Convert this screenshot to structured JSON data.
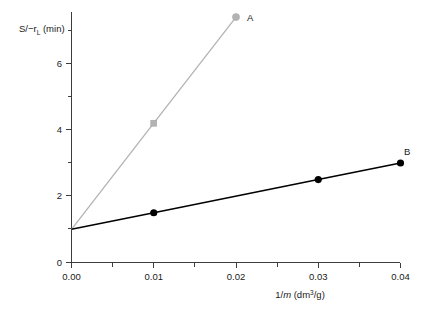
{
  "chart_data": {
    "type": "line",
    "title": "",
    "xlabel": "1/m (dm³/g)",
    "ylabel": "S/−rₗ (min)",
    "xlim": [
      0.0,
      0.04
    ],
    "ylim": [
      0.0,
      7.7
    ],
    "grid": false,
    "legend_position": "inline-end-of-line",
    "x_ticks": [
      {
        "value": 0.0,
        "label": "0.00"
      },
      {
        "value": 0.01,
        "label": "0.01"
      },
      {
        "value": 0.02,
        "label": "0.02"
      },
      {
        "value": 0.03,
        "label": "0.03"
      },
      {
        "value": 0.04,
        "label": "0.04"
      }
    ],
    "x_minor_ticks": [
      0.005,
      0.015,
      0.025,
      0.035
    ],
    "y_ticks": [
      {
        "value": 0,
        "label": "0"
      },
      {
        "value": 2,
        "label": "2"
      },
      {
        "value": 4,
        "label": "4"
      },
      {
        "value": 6,
        "label": "6"
      }
    ],
    "y_minor_ticks": [
      1,
      3,
      5,
      7
    ],
    "series": [
      {
        "name": "A",
        "label": "A",
        "color": "#b3b3b3",
        "marker": "square",
        "marker_color": "#b3b3b3",
        "x": [
          0.0,
          0.01,
          0.02
        ],
        "values": [
          1.0,
          4.2,
          7.4
        ],
        "points_with_markers": [
          {
            "x": 0.01,
            "y": 4.2
          },
          {
            "x": 0.02,
            "y": 7.4
          }
        ]
      },
      {
        "name": "B",
        "label": "B",
        "color": "#000000",
        "marker": "circle",
        "marker_color": "#000000",
        "x": [
          0.0,
          0.01,
          0.03,
          0.04
        ],
        "values": [
          1.0,
          1.5,
          2.5,
          3.0
        ],
        "points_with_markers": [
          {
            "x": 0.01,
            "y": 1.5
          },
          {
            "x": 0.03,
            "y": 2.5
          },
          {
            "x": 0.04,
            "y": 3.0
          }
        ]
      }
    ]
  },
  "axis": {
    "ylabel_main": "S/−r",
    "ylabel_subscript": "L",
    "ylabel_units": "(min)",
    "xlabel_prefix": "1/",
    "xlabel_italic": "m",
    "xlabel_units_open": "(dm",
    "xlabel_units_sup": "3",
    "xlabel_units_close": "/g)"
  },
  "ticks": {
    "x": [
      "0.00",
      "0.01",
      "0.02",
      "0.03",
      "0.04"
    ],
    "y": [
      "0",
      "2",
      "4",
      "6"
    ]
  },
  "labels": {
    "series_a": "A",
    "series_b": "B"
  },
  "colors": {
    "series_a": "#b3b3b3",
    "series_b": "#000000",
    "axis": "#3d3d3d",
    "text": "#1a1a1a",
    "background": "#ffffff"
  }
}
